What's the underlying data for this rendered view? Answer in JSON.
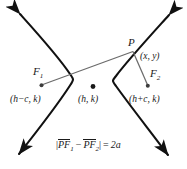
{
  "figure": {
    "stroke_color": "#111111",
    "segment_color": "#5a5a5a",
    "background": "#ffffff"
  },
  "labels": {
    "focus1_name": "F",
    "focus1_sub": "1",
    "focus1_coord": "(h−c, k)",
    "center_coord": "(h, k)",
    "focus2_name": "F",
    "focus2_sub": "2",
    "focus2_coord": "(h+c, k)",
    "point_name": "P",
    "point_coord": "(x, y)"
  },
  "equation": {
    "open_bar": "|",
    "term1": "PF",
    "term1_sub": "1",
    "minus": "−",
    "term2": "PF",
    "term2_sub": "2",
    "close_bar": "|",
    "equals": "=",
    "right_side": "2a",
    "plain_text": "|PF₁ − PF₂| = 2a"
  },
  "geometry": {
    "center": [
      93,
      87
    ],
    "focus1": [
      41,
      85
    ],
    "focus2": [
      148,
      86
    ],
    "point_p": [
      133,
      51
    ],
    "left_vertex": [
      73,
      79
    ],
    "right_vertex": [
      113,
      80
    ],
    "arrow_tips": [
      [
        17,
        11
      ],
      [
        172,
        12
      ],
      [
        15,
        157
      ],
      [
        170,
        158
      ]
    ]
  }
}
